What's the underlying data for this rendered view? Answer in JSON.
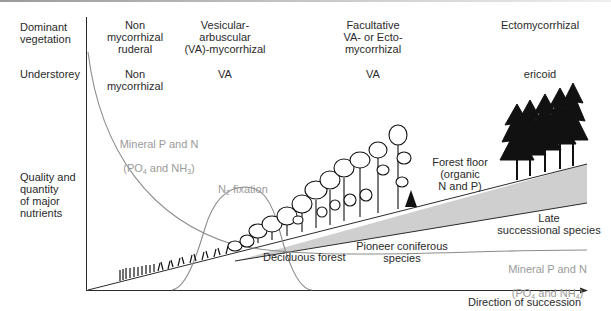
{
  "rows": {
    "dominant_vegetation": "Dominant\nvegetation",
    "understorey": "Understorey",
    "nutrients": "Quality and\nquantity\nof major\nnutrients"
  },
  "stages": [
    {
      "dominant": "Non\nmycorrhizal\nruderal",
      "understorey": "Non\nmycorrhizal"
    },
    {
      "dominant": "Vesicular-\narbuscular\n(VA)-mycorrhizal",
      "understorey": "VA"
    },
    {
      "dominant": "Facultative\nVA- or Ecto-\nmycorrhizal",
      "understorey": "VA"
    },
    {
      "dominant": "Ectomycorrhizal",
      "understorey": "ericoid"
    }
  ],
  "curves": {
    "mineral_early": {
      "line1": "Mineral P and N",
      "line2_pre": "(PO",
      "sub1": "4",
      "line2_mid": " and NH",
      "sub2": "3",
      "line2_post": ")"
    },
    "n2_fixation": {
      "pre": "N",
      "sub": "2",
      "post": " fixation"
    },
    "forest_floor": "Forest floor\n(organic\nN and P)",
    "late_successional": "Late\nsuccessional species",
    "pioneer_coniferous": "Pioneer coniferous\nspecies",
    "deciduous_forest": "Deciduous forest",
    "mineral_late": {
      "line1": "Mineral P and N",
      "line2_pre": "(PO",
      "sub1": "4",
      "line2_mid": " and NH",
      "sub2": "4",
      "line2_post": ")"
    }
  },
  "axis": {
    "x_label": "Direction of succession"
  },
  "colors": {
    "curve": "#8c8c8c",
    "wedge": "#cfcfcf",
    "axis": "#2a2a2a",
    "gray_text": "#9a9a9a"
  }
}
